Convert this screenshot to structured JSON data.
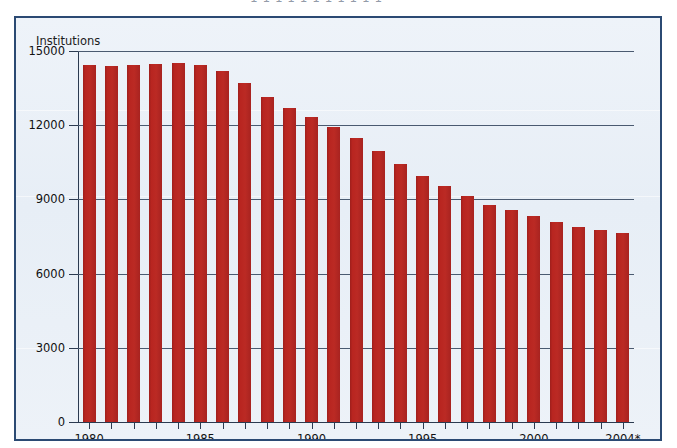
{
  "top_fragment": "1  1 1    1 1  1    1 1    1 1 1",
  "colors": {
    "bar": "#b5241f",
    "panel_border": "#2b4a73",
    "panel_background": "#e9f0f7",
    "axis": "#2b3a50",
    "text": "#111111"
  },
  "chart_data": {
    "type": "bar",
    "title": "",
    "xlabel": "",
    "ylabel": "Institutions",
    "ylim": [
      0,
      15000
    ],
    "yticks": [
      0,
      3000,
      6000,
      9000,
      12000,
      15000
    ],
    "ytick_labels": [
      "0",
      "3000",
      "6000",
      "9000",
      "12000",
      "15000"
    ],
    "grid": true,
    "legend": false,
    "categories": [
      "1980",
      "1981",
      "1982",
      "1983",
      "1984",
      "1985",
      "1986",
      "1987",
      "1988",
      "1989",
      "1990",
      "1991",
      "1992",
      "1993",
      "1994",
      "1995",
      "1996",
      "1997",
      "1998",
      "1999",
      "2000",
      "2001",
      "2002",
      "2003",
      "2004*"
    ],
    "xtick_labels": [
      "1980",
      "1985",
      "1990",
      "1995",
      "2000",
      "2004*"
    ],
    "xtick_label_indices": [
      0,
      5,
      10,
      15,
      20,
      24
    ],
    "values": [
      14434,
      14414,
      14451,
      14469,
      14496,
      14417,
      14210,
      13723,
      13137,
      12715,
      12347,
      11927,
      11466,
      10960,
      10452,
      9942,
      9528,
      9143,
      8774,
      8581,
      8315,
      8079,
      7888,
      7770,
      7630
    ],
    "footnote_marker": "*"
  }
}
